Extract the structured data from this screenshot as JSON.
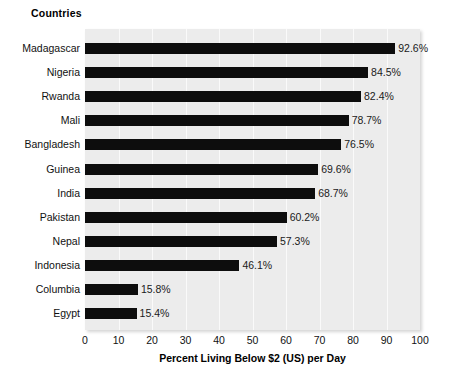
{
  "chart_data": {
    "type": "bar",
    "orientation": "horizontal",
    "title": "Countries",
    "xlabel": "Percent Living Below $2 (US) per Day",
    "ylabel": "Countries",
    "xlim": [
      0,
      100
    ],
    "xticks": [
      "0",
      "10",
      "20",
      "30",
      "40",
      "50",
      "60",
      "70",
      "80",
      "90",
      "100"
    ],
    "grid": "vertical",
    "legend": "none",
    "categories": [
      "Madagascar",
      "Nigeria",
      "Rwanda",
      "Mali",
      "Bangladesh",
      "Guinea",
      "India",
      "Pakistan",
      "Nepal",
      "Indonesia",
      "Columbia",
      "Egypt"
    ],
    "values": [
      92.6,
      84.5,
      82.4,
      78.7,
      76.5,
      69.6,
      68.7,
      60.2,
      57.3,
      46.1,
      15.8,
      15.4
    ],
    "data_labels": [
      "92.6%",
      "84.5%",
      "82.4%",
      "78.7%",
      "76.5%",
      "69.6%",
      "68.7%",
      "60.2%",
      "57.3%",
      "46.1%",
      "15.8%",
      "15.4%"
    ],
    "colors": {
      "bar": "#0d0d0d",
      "plot_background": "#ececec",
      "gridline": "#fafafa",
      "text": "#111111",
      "page_background": "#ffffff"
    }
  }
}
